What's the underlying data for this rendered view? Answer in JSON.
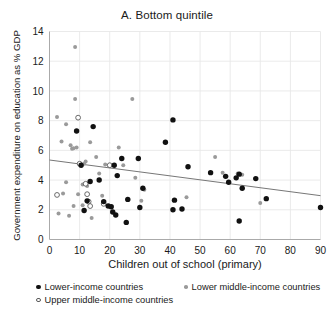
{
  "chart_data": {
    "type": "scatter",
    "title": "A. Bottom quintile",
    "xlabel": "Children out of school (primary)",
    "ylabel": "Government expenditure on education as % GDP",
    "xlim": [
      0,
      90
    ],
    "ylim": [
      0,
      14
    ],
    "xticks": [
      0,
      10,
      20,
      30,
      40,
      50,
      60,
      70,
      80,
      90
    ],
    "yticks": [
      0,
      2,
      4,
      6,
      8,
      10,
      12,
      14
    ],
    "grid": true,
    "legend_position": "below-axis",
    "series": [
      {
        "name": "Lower-income countries",
        "marker": "filled-circle",
        "color": "#111111",
        "points": [
          [
            9.0,
            7.3
          ],
          [
            14.5,
            7.6
          ],
          [
            41.0,
            8.05
          ],
          [
            38.5,
            6.55
          ],
          [
            24.0,
            5.45
          ],
          [
            29.5,
            5.45
          ],
          [
            21.5,
            5.0
          ],
          [
            10.5,
            5.0
          ],
          [
            46.0,
            4.9
          ],
          [
            53.5,
            4.5
          ],
          [
            63.0,
            4.4
          ],
          [
            62.0,
            4.15
          ],
          [
            68.5,
            4.1
          ],
          [
            58.5,
            4.25
          ],
          [
            59.5,
            3.85
          ],
          [
            64.0,
            3.45
          ],
          [
            13.5,
            3.9
          ],
          [
            16.5,
            4.0
          ],
          [
            22.5,
            4.3
          ],
          [
            31.0,
            3.45
          ],
          [
            26.0,
            2.7
          ],
          [
            18.0,
            2.55
          ],
          [
            41.5,
            2.65
          ],
          [
            44.0,
            2.05
          ],
          [
            72.0,
            2.75
          ],
          [
            90.0,
            2.15
          ],
          [
            11.5,
            1.95
          ],
          [
            20.5,
            2.2
          ],
          [
            19.5,
            2.25
          ],
          [
            22.0,
            1.65
          ],
          [
            25.5,
            1.15
          ],
          [
            63.0,
            1.25
          ],
          [
            41.0,
            2.0
          ],
          [
            21.0,
            1.85
          ],
          [
            12.5,
            2.6
          ],
          [
            30.0,
            2.15
          ]
        ]
      },
      {
        "name": "Lower middle-income countries",
        "marker": "small-gray-circle",
        "color": "#9a9a9a",
        "points": [
          [
            8.5,
            12.95
          ],
          [
            8.5,
            9.45
          ],
          [
            27.5,
            9.45
          ],
          [
            2.5,
            8.25
          ],
          [
            5.5,
            7.75
          ],
          [
            4.0,
            6.6
          ],
          [
            7.0,
            6.35
          ],
          [
            9.0,
            6.2
          ],
          [
            7.5,
            6.1
          ],
          [
            8.0,
            6.15
          ],
          [
            13.5,
            6.55
          ],
          [
            23.0,
            6.2
          ],
          [
            15.5,
            5.55
          ],
          [
            24.5,
            5.0
          ],
          [
            12.0,
            5.25
          ],
          [
            11.5,
            5.1
          ],
          [
            18.5,
            5.05
          ],
          [
            55.0,
            5.55
          ],
          [
            57.5,
            4.5
          ],
          [
            62.5,
            4.45
          ],
          [
            64.0,
            4.35
          ],
          [
            16.5,
            4.45
          ],
          [
            28.5,
            4.15
          ],
          [
            5.5,
            3.85
          ],
          [
            11.0,
            3.7
          ],
          [
            12.5,
            3.6
          ],
          [
            31.5,
            3.35
          ],
          [
            4.5,
            3.1
          ],
          [
            9.5,
            3.05
          ],
          [
            17.5,
            2.95
          ],
          [
            45.5,
            2.85
          ],
          [
            30.5,
            2.6
          ],
          [
            8.0,
            2.25
          ],
          [
            11.0,
            2.3
          ],
          [
            3.0,
            1.75
          ],
          [
            70.0,
            2.45
          ],
          [
            6.5,
            1.6
          ],
          [
            14.0,
            1.45
          ]
        ]
      },
      {
        "name": "Upper middle-income countries",
        "marker": "hollow-circle",
        "color": "#5a5a5a",
        "points": [
          [
            9.5,
            8.2
          ],
          [
            10.0,
            5.1
          ],
          [
            20.0,
            5.0
          ],
          [
            12.0,
            3.75
          ],
          [
            12.5,
            3.05
          ],
          [
            2.5,
            3.0
          ],
          [
            13.0,
            2.55
          ],
          [
            18.0,
            2.4
          ],
          [
            13.5,
            2.25
          ]
        ]
      }
    ],
    "trendline": {
      "name": "linear-fit",
      "color": "#777777",
      "x_start": 0,
      "y_start": 5.35,
      "x_end": 90,
      "y_end": 2.95
    }
  },
  "legend": {
    "entries": [
      {
        "label": "Lower-income countries",
        "marker": "filled"
      },
      {
        "label": "Lower middle-income countries",
        "marker": "gray"
      },
      {
        "label": "Upper middle-income countries",
        "marker": "hollow"
      }
    ]
  }
}
